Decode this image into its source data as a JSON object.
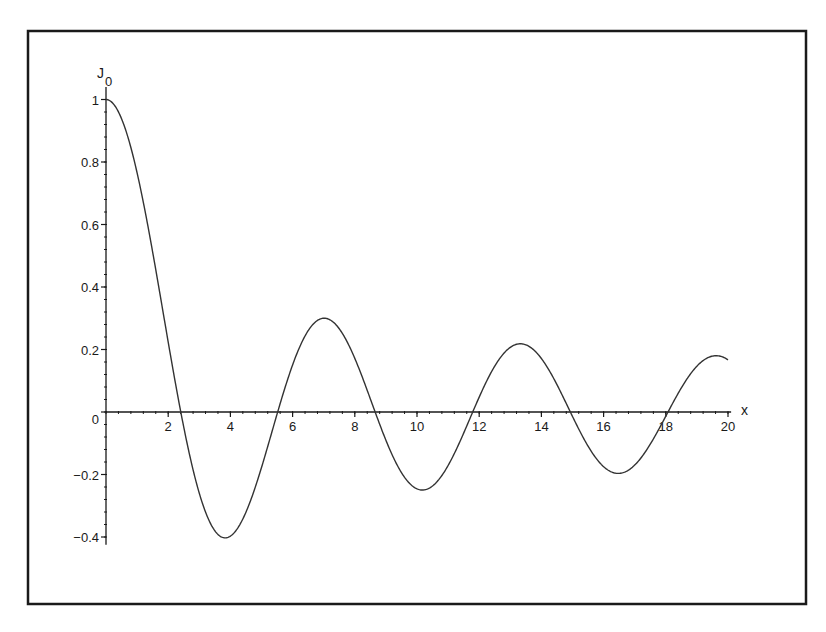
{
  "chart_data": {
    "type": "line",
    "title": "",
    "xlabel": "x",
    "ylabel": "J0",
    "ylabel_main": "J",
    "ylabel_sub": "0",
    "function": "Bessel function of the first kind J0(x)",
    "xlim": [
      0,
      20
    ],
    "ylim": [
      -0.4,
      1
    ],
    "grid": false,
    "legend": null,
    "x_ticks": [
      2,
      4,
      6,
      8,
      10,
      12,
      14,
      16,
      18,
      20
    ],
    "x_tick_labels": [
      "2",
      "4",
      "6",
      "8",
      "10",
      "12",
      "14",
      "16",
      "18",
      "20"
    ],
    "y_ticks": [
      1,
      0.8,
      0.6,
      0.4,
      0.2,
      0,
      -0.2,
      -0.4
    ],
    "y_tick_labels": [
      "1",
      "0.8",
      "0.6",
      "0.4",
      "0.2",
      "0",
      "−0.2",
      "−0.4"
    ],
    "series": [
      {
        "name": "J0(x)",
        "color": "#333333",
        "x": [
          0,
          0.5,
          1,
          1.5,
          2,
          2.5,
          3,
          3.5,
          4,
          4.5,
          5,
          5.5,
          6,
          6.5,
          7,
          7.5,
          8,
          8.5,
          9,
          9.5,
          10,
          10.5,
          11,
          11.5,
          12,
          12.5,
          13,
          13.5,
          14,
          14.5,
          15,
          15.5,
          16,
          16.5,
          17,
          17.5,
          18,
          18.5,
          19,
          19.5,
          20
        ],
        "y": [
          1.0,
          0.938,
          0.765,
          0.512,
          0.224,
          -0.048,
          -0.26,
          -0.38,
          -0.397,
          -0.321,
          -0.178,
          -0.007,
          0.151,
          0.26,
          0.3,
          0.266,
          0.172,
          0.042,
          -0.09,
          -0.194,
          -0.246,
          -0.237,
          -0.171,
          -0.068,
          0.048,
          0.147,
          0.207,
          0.215,
          0.171,
          0.087,
          -0.014,
          -0.109,
          -0.175,
          -0.196,
          -0.17,
          -0.103,
          -0.014,
          0.074,
          0.147,
          0.18,
          0.167
        ]
      }
    ],
    "annotations": {
      "zeros": [
        2.405,
        5.52,
        8.654,
        11.792,
        14.931,
        18.071
      ],
      "extrema": [
        {
          "x": 0,
          "y": 1.0
        },
        {
          "x": 3.832,
          "y": -0.403
        },
        {
          "x": 7.016,
          "y": 0.3
        },
        {
          "x": 10.173,
          "y": -0.25
        },
        {
          "x": 13.324,
          "y": 0.218
        },
        {
          "x": 16.471,
          "y": -0.196
        },
        {
          "x": 19.616,
          "y": 0.18
        }
      ]
    }
  },
  "colors": {
    "background": "#ffffff",
    "frame": "#1a1a1a",
    "axis": "#1a1a1a",
    "curve": "#333333"
  }
}
